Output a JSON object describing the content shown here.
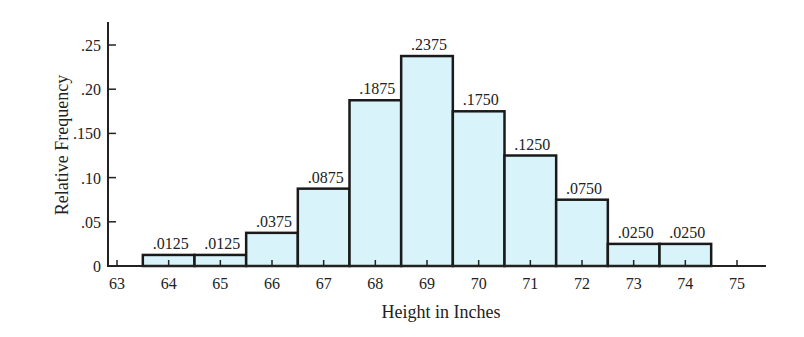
{
  "chart_data": {
    "type": "bar",
    "subtype": "histogram",
    "title": "",
    "xlabel": "Height in Inches",
    "ylabel": "Relative Frequency",
    "categories": [
      "64",
      "65",
      "66",
      "67",
      "68",
      "69",
      "70",
      "71",
      "72",
      "73",
      "74"
    ],
    "values": [
      0.0125,
      0.0125,
      0.0375,
      0.0875,
      0.1875,
      0.2375,
      0.175,
      0.125,
      0.075,
      0.025,
      0.025
    ],
    "value_labels": [
      ".0125",
      ".0125",
      ".0375",
      ".0875",
      ".1875",
      ".2375",
      ".1750",
      ".1250",
      ".0750",
      ".0250",
      ".0250"
    ],
    "x_ticks": [
      "63",
      "64",
      "65",
      "66",
      "67",
      "68",
      "69",
      "70",
      "71",
      "72",
      "73",
      "74",
      "75"
    ],
    "y_ticks": [
      {
        "value": 0,
        "label": "0"
      },
      {
        "value": 0.05,
        "label": ".05"
      },
      {
        "value": 0.1,
        "label": ".10"
      },
      {
        "value": 0.15,
        "label": ".150"
      },
      {
        "value": 0.2,
        "label": ".20"
      },
      {
        "value": 0.25,
        "label": ".25"
      }
    ],
    "xlim": [
      63,
      75
    ],
    "ylim": [
      0,
      0.27
    ],
    "grid": false,
    "legend": null,
    "bar_color": "#d9f3fa",
    "edge_color": "#1a1a1a"
  }
}
